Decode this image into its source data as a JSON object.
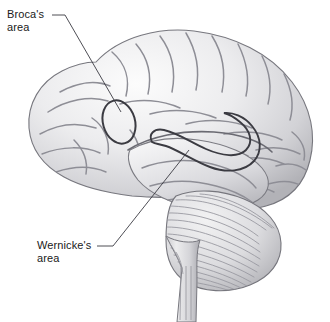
{
  "figure": {
    "background_color": "#ffffff",
    "width": 330,
    "height": 322
  },
  "labels": [
    {
      "id": "brocas",
      "line1": "Broca's",
      "line2": "area",
      "marker_shape": "oval",
      "leader_color": "#3a3a42"
    },
    {
      "id": "wernickes",
      "line1": "Wernicke's",
      "line2": "area",
      "marker_shape": "hook-loop",
      "leader_color": "#3a3a42"
    }
  ],
  "anatomy": {
    "cerebrum": "cerebrum",
    "cerebellum": "cerebellum",
    "brainstem": "brainstem",
    "outline_color": "#6e6e75",
    "fill_light": "#f4f4f4",
    "fill_mid": "#d6d6d8",
    "fill_shadow": "#a9a9ad",
    "sulci_color": "#8d8d94"
  }
}
